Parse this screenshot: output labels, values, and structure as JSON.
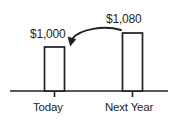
{
  "chart_data": {
    "type": "bar",
    "title": "",
    "subtitle": "",
    "xlabel": "",
    "ylabel": "",
    "categories": [
      "Today",
      "Next Year"
    ],
    "values": [
      1000,
      1080
    ],
    "value_labels": [
      "$1,000",
      "$1,080"
    ],
    "ylim": [
      0,
      1200
    ],
    "grid": false,
    "legend": null,
    "bar_style": "outline",
    "annotations": [
      {
        "name": "growth-arrow",
        "type": "curved-arrow",
        "from_category": "Next Year",
        "to_category": "Today",
        "text": ""
      }
    ],
    "axis": {
      "baseline": true,
      "ticks": [
        "Today",
        "Next Year"
      ]
    },
    "colors": {
      "stroke": "#231f20",
      "bar_fill": "#ffffff",
      "background": "#ffffff",
      "text": "#231f20"
    }
  },
  "geometry": {
    "baseline_y": 91,
    "baseline_x0": 10,
    "baseline_x1": 168,
    "bars": [
      {
        "x": 44.5,
        "width": 20,
        "top": 47,
        "tick_x": 54.5
      },
      {
        "x": 122.5,
        "width": 20,
        "top": 33,
        "tick_x": 132.5
      }
    ],
    "arrow": {
      "start_x": 121,
      "start_y": 30,
      "ctrl1_x": 104,
      "ctrl1_y": 25,
      "ctrl2_x": 80,
      "ctrl2_y": 29,
      "end_x": 71,
      "end_y": 41
    }
  }
}
